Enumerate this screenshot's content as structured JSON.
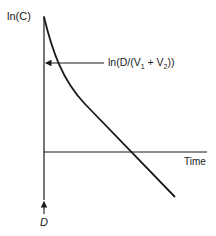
{
  "diagram": {
    "y_axis_label": "ln(C)",
    "x_axis_label": "Time",
    "intercept_label": {
      "prefix": "ln(D/(V",
      "sub1": "1",
      "mid": " + V",
      "sub2": "2",
      "suffix": "))"
    },
    "dose_label": "D",
    "curve_description": "biexponential decline: curved distribution phase followed by linear elimination phase",
    "colors": {
      "ink": "#1a1a1a",
      "background": "#ffffff"
    }
  }
}
